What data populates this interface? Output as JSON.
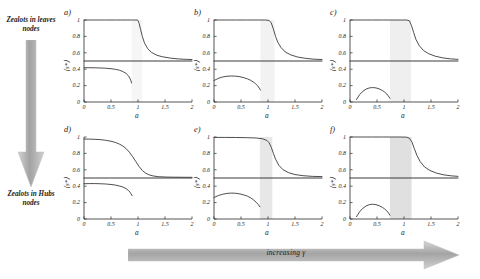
{
  "figure": {
    "left_rail": {
      "top_label": "Zealots in leaves nodes",
      "bottom_label": "Zealots in Hubs nodes",
      "arrow_icon": "down-arrow-icon",
      "arrow_color": "#a8a8a8"
    },
    "bottom_rail": {
      "label": "increasing γ",
      "arrow_icon": "right-arrow-icon",
      "arrow_color": "#a8a8a8"
    },
    "axes": {
      "xlabel": "a",
      "ylabel": "⟨s*⟩",
      "xlim": [
        0,
        2
      ],
      "ylim": [
        0,
        1
      ],
      "xticks": [
        0,
        0.5,
        1,
        1.5,
        2
      ],
      "xticklabels": [
        "0",
        "0.5",
        "1",
        "1.5",
        "2"
      ],
      "yticks": [
        0,
        0.2,
        0.4,
        0.6,
        0.8,
        1
      ],
      "yticklabels": [
        "0",
        "0.2",
        "0.4",
        "0.6",
        "0.8",
        "1"
      ],
      "grid": false
    },
    "curve_color": "#3a3a3a",
    "band_color_base": "#c6c6c6"
  },
  "chart_data": [
    {
      "id": "panel-a",
      "type": "line",
      "tag": "a)",
      "title": "",
      "xlabel": "a",
      "ylabel": "⟨s*⟩",
      "xlim": [
        0,
        2
      ],
      "ylim": [
        0,
        1
      ],
      "xticks": [
        0,
        0.5,
        1,
        1.5,
        2
      ],
      "yticks": [
        0,
        0.2,
        0.4,
        0.6,
        0.8,
        1
      ],
      "grid": false,
      "legend": null,
      "shaded_band": {
        "x0": 0.88,
        "x1": 1.08,
        "opacity": 0.16,
        "label": "bistable region"
      },
      "series": [
        {
          "name": "upper-consensus-branch",
          "style": "solid",
          "x": [
            0.0,
            0.1,
            0.2,
            0.3,
            0.4,
            0.5,
            0.6,
            0.7,
            0.8,
            0.86,
            0.9,
            0.94,
            0.98,
            1.0,
            1.02,
            1.05,
            1.08,
            1.12,
            1.18,
            1.25,
            1.35,
            1.45,
            1.6,
            1.75,
            1.9,
            2.0
          ],
          "y": [
            1.0,
            1.0,
            1.0,
            1.0,
            1.0,
            1.0,
            1.0,
            1.0,
            1.0,
            1.0,
            1.0,
            1.0,
            1.0,
            0.995,
            0.96,
            0.88,
            0.8,
            0.72,
            0.65,
            0.605,
            0.57,
            0.552,
            0.535,
            0.525,
            0.52,
            0.518
          ]
        },
        {
          "name": "symmetric-branch",
          "style": "solid",
          "x": [
            0.0,
            2.0
          ],
          "y": [
            0.5,
            0.5
          ]
        },
        {
          "name": "lower-branch",
          "style": "solid",
          "x": [
            0.0,
            0.1,
            0.2,
            0.3,
            0.4,
            0.5,
            0.58,
            0.66,
            0.72,
            0.78,
            0.82,
            0.85,
            0.87,
            0.88
          ],
          "y": [
            0.418,
            0.418,
            0.417,
            0.415,
            0.412,
            0.406,
            0.399,
            0.387,
            0.372,
            0.348,
            0.322,
            0.29,
            0.258,
            0.232
          ]
        }
      ]
    },
    {
      "id": "panel-b",
      "type": "line",
      "tag": "b)",
      "xlabel": "a",
      "ylabel": "⟨s*⟩",
      "xlim": [
        0,
        2
      ],
      "ylim": [
        0,
        1
      ],
      "xticks": [
        0,
        0.5,
        1,
        1.5,
        2
      ],
      "yticks": [
        0,
        0.2,
        0.4,
        0.6,
        0.8,
        1
      ],
      "grid": false,
      "shaded_band": {
        "x0": 0.86,
        "x1": 1.12,
        "opacity": 0.22,
        "label": "bistable region"
      },
      "series": [
        {
          "name": "upper-consensus-branch",
          "style": "solid",
          "x": [
            0.0,
            0.2,
            0.4,
            0.6,
            0.8,
            0.95,
            1.02,
            1.06,
            1.1,
            1.14,
            1.18,
            1.24,
            1.32,
            1.42,
            1.55,
            1.7,
            1.85,
            2.0
          ],
          "y": [
            1.0,
            1.0,
            1.0,
            1.0,
            1.0,
            1.0,
            0.995,
            0.965,
            0.89,
            0.8,
            0.73,
            0.665,
            0.61,
            0.575,
            0.548,
            0.532,
            0.522,
            0.518
          ]
        },
        {
          "name": "symmetric-branch",
          "style": "solid",
          "x": [
            0.0,
            2.0
          ],
          "y": [
            0.5,
            0.5
          ]
        },
        {
          "name": "lower-branch",
          "style": "solid",
          "x": [
            0.0,
            0.08,
            0.16,
            0.24,
            0.32,
            0.4,
            0.48,
            0.56,
            0.62,
            0.68,
            0.73,
            0.77,
            0.81,
            0.84,
            0.86
          ],
          "y": [
            0.262,
            0.288,
            0.305,
            0.314,
            0.317,
            0.315,
            0.308,
            0.295,
            0.282,
            0.264,
            0.243,
            0.222,
            0.196,
            0.168,
            0.145
          ]
        }
      ]
    },
    {
      "id": "panel-c",
      "type": "line",
      "tag": "c)",
      "xlabel": "a",
      "ylabel": "⟨s*⟩",
      "xlim": [
        0,
        2
      ],
      "ylim": [
        0,
        1
      ],
      "xticks": [
        0,
        0.5,
        1,
        1.5,
        2
      ],
      "yticks": [
        0,
        0.2,
        0.4,
        0.6,
        0.8,
        1
      ],
      "grid": false,
      "shaded_band": {
        "x0": 0.74,
        "x1": 1.13,
        "opacity": 0.28,
        "label": "bistable region"
      },
      "series": [
        {
          "name": "upper-consensus-branch",
          "style": "solid",
          "x": [
            0.0,
            0.2,
            0.4,
            0.6,
            0.8,
            0.95,
            1.05,
            1.1,
            1.14,
            1.18,
            1.22,
            1.28,
            1.36,
            1.46,
            1.58,
            1.72,
            1.86,
            2.0
          ],
          "y": [
            1.0,
            1.0,
            1.0,
            1.0,
            1.0,
            1.0,
            1.0,
            0.99,
            0.93,
            0.845,
            0.765,
            0.69,
            0.628,
            0.588,
            0.558,
            0.538,
            0.526,
            0.52
          ]
        },
        {
          "name": "symmetric-branch",
          "style": "solid",
          "x": [
            0.0,
            2.0
          ],
          "y": [
            0.5,
            0.5
          ]
        },
        {
          "name": "lower-branch",
          "style": "solid",
          "x": [
            0.12,
            0.18,
            0.24,
            0.3,
            0.36,
            0.42,
            0.48,
            0.54,
            0.6,
            0.64,
            0.68,
            0.71,
            0.74
          ],
          "y": [
            0.03,
            0.092,
            0.132,
            0.158,
            0.172,
            0.176,
            0.172,
            0.16,
            0.14,
            0.122,
            0.098,
            0.074,
            0.044
          ]
        }
      ]
    },
    {
      "id": "panel-d",
      "type": "line",
      "tag": "d)",
      "xlabel": "a",
      "ylabel": "⟨s*⟩",
      "xlim": [
        0,
        2
      ],
      "ylim": [
        0,
        1
      ],
      "xticks": [
        0,
        0.5,
        1,
        1.5,
        2
      ],
      "yticks": [
        0,
        0.2,
        0.4,
        0.6,
        0.8,
        1
      ],
      "grid": false,
      "shaded_band": null,
      "series": [
        {
          "name": "upper-consensus-branch",
          "style": "solid",
          "x": [
            0.0,
            0.1,
            0.2,
            0.3,
            0.4,
            0.5,
            0.58,
            0.66,
            0.72,
            0.78,
            0.84,
            0.9,
            0.96,
            1.02,
            1.08,
            1.14,
            1.2,
            1.28,
            1.38,
            1.5,
            1.65,
            1.8,
            2.0
          ],
          "y": [
            0.975,
            0.974,
            0.972,
            0.968,
            0.96,
            0.948,
            0.934,
            0.912,
            0.89,
            0.858,
            0.815,
            0.76,
            0.7,
            0.64,
            0.592,
            0.56,
            0.54,
            0.525,
            0.516,
            0.512,
            0.51,
            0.509,
            0.508
          ]
        },
        {
          "name": "symmetric-branch",
          "style": "solid",
          "x": [
            0.0,
            2.0
          ],
          "y": [
            0.5,
            0.5
          ]
        },
        {
          "name": "lower-branch",
          "style": "solid",
          "x": [
            0.0,
            0.1,
            0.2,
            0.3,
            0.4,
            0.5,
            0.58,
            0.66,
            0.72,
            0.78,
            0.82,
            0.85,
            0.87,
            0.89
          ],
          "y": [
            0.43,
            0.432,
            0.432,
            0.43,
            0.427,
            0.421,
            0.414,
            0.402,
            0.39,
            0.37,
            0.35,
            0.328,
            0.308,
            0.285
          ]
        }
      ]
    },
    {
      "id": "panel-e",
      "type": "line",
      "tag": "e)",
      "xlabel": "a",
      "ylabel": "⟨s*⟩",
      "xlim": [
        0,
        2
      ],
      "ylim": [
        0,
        1
      ],
      "xticks": [
        0,
        0.5,
        1,
        1.5,
        2
      ],
      "yticks": [
        0,
        0.2,
        0.4,
        0.6,
        0.8,
        1
      ],
      "grid": false,
      "shaded_band": {
        "x0": 0.85,
        "x1": 1.08,
        "opacity": 0.42,
        "label": "bistable region"
      },
      "series": [
        {
          "name": "upper-consensus-branch",
          "style": "solid",
          "x": [
            0.0,
            0.2,
            0.4,
            0.6,
            0.78,
            0.9,
            0.98,
            1.02,
            1.06,
            1.1,
            1.14,
            1.2,
            1.28,
            1.38,
            1.5,
            1.65,
            1.82,
            2.0
          ],
          "y": [
            0.995,
            0.995,
            0.994,
            0.992,
            0.988,
            0.978,
            0.958,
            0.93,
            0.875,
            0.8,
            0.73,
            0.655,
            0.6,
            0.565,
            0.542,
            0.528,
            0.52,
            0.517
          ]
        },
        {
          "name": "symmetric-branch",
          "style": "solid",
          "x": [
            0.0,
            2.0
          ],
          "y": [
            0.5,
            0.5
          ]
        },
        {
          "name": "lower-branch",
          "style": "solid",
          "x": [
            0.0,
            0.08,
            0.16,
            0.24,
            0.32,
            0.4,
            0.48,
            0.56,
            0.62,
            0.68,
            0.73,
            0.78,
            0.82,
            0.85
          ],
          "y": [
            0.262,
            0.286,
            0.302,
            0.312,
            0.316,
            0.314,
            0.306,
            0.292,
            0.278,
            0.258,
            0.234,
            0.205,
            0.176,
            0.148
          ]
        }
      ]
    },
    {
      "id": "panel-f",
      "type": "line",
      "tag": "f)",
      "xlabel": "a",
      "ylabel": "⟨s*⟩",
      "xlim": [
        0,
        2
      ],
      "ylim": [
        0,
        1
      ],
      "xticks": [
        0,
        0.5,
        1,
        1.5,
        2
      ],
      "yticks": [
        0,
        0.2,
        0.4,
        0.6,
        0.8,
        1
      ],
      "grid": false,
      "shaded_band": {
        "x0": 0.74,
        "x1": 1.14,
        "opacity": 0.55,
        "label": "bistable region"
      },
      "series": [
        {
          "name": "upper-consensus-branch",
          "style": "solid",
          "x": [
            0.0,
            0.2,
            0.4,
            0.6,
            0.8,
            0.95,
            1.05,
            1.1,
            1.15,
            1.19,
            1.24,
            1.3,
            1.38,
            1.48,
            1.6,
            1.74,
            1.88,
            2.0
          ],
          "y": [
            1.0,
            1.0,
            1.0,
            1.0,
            1.0,
            1.0,
            0.998,
            0.985,
            0.935,
            0.86,
            0.775,
            0.7,
            0.635,
            0.592,
            0.56,
            0.538,
            0.526,
            0.52
          ]
        },
        {
          "name": "symmetric-branch",
          "style": "solid",
          "x": [
            0.0,
            2.0
          ],
          "y": [
            0.5,
            0.5
          ]
        },
        {
          "name": "lower-branch",
          "style": "solid",
          "x": [
            0.12,
            0.18,
            0.24,
            0.3,
            0.36,
            0.42,
            0.48,
            0.54,
            0.6,
            0.64,
            0.68,
            0.71,
            0.74
          ],
          "y": [
            0.028,
            0.09,
            0.132,
            0.16,
            0.176,
            0.18,
            0.175,
            0.162,
            0.142,
            0.124,
            0.1,
            0.076,
            0.046
          ]
        }
      ]
    }
  ]
}
